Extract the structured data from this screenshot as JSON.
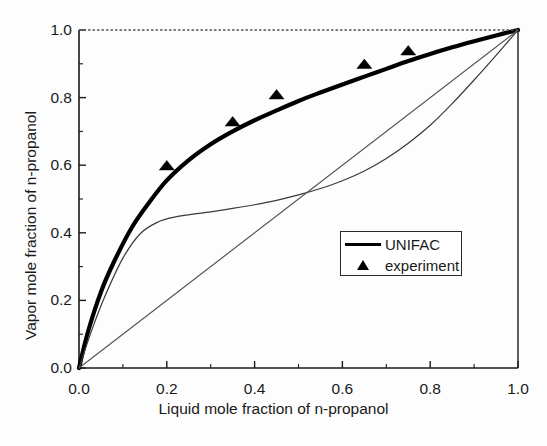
{
  "chart_data": {
    "type": "line",
    "title": "",
    "subtitle": "",
    "xlabel": "Liquid mole fraction of n-propanol",
    "ylabel": "Vapor mole fraction of n-propanol",
    "xlim": [
      0.0,
      1.0
    ],
    "ylim": [
      0.0,
      1.0
    ],
    "xticks": [
      "0.0",
      "0.2",
      "0.4",
      "0.6",
      "0.8",
      "1.0"
    ],
    "xtick_values": [
      0.0,
      0.2,
      0.4,
      0.6,
      0.8,
      1.0
    ],
    "yticks": [
      "0.0",
      "0.2",
      "0.4",
      "0.6",
      "0.8",
      "1.0"
    ],
    "ytick_values": [
      0.0,
      0.2,
      0.4,
      0.6,
      0.8,
      1.0
    ],
    "minor_ticks": true,
    "grid": false,
    "legend_position": "center-right",
    "series": [
      {
        "name": "UNIFAC",
        "style": "thick-line",
        "color": "#000000",
        "x": [
          0.0,
          0.02,
          0.05,
          0.08,
          0.12,
          0.16,
          0.2,
          0.25,
          0.3,
          0.35,
          0.4,
          0.45,
          0.5,
          0.55,
          0.6,
          0.65,
          0.7,
          0.75,
          0.8,
          0.85,
          0.9,
          0.95,
          1.0
        ],
        "y": [
          0.0,
          0.105,
          0.225,
          0.315,
          0.415,
          0.49,
          0.555,
          0.615,
          0.662,
          0.7,
          0.733,
          0.762,
          0.79,
          0.815,
          0.839,
          0.862,
          0.885,
          0.908,
          0.929,
          0.949,
          0.967,
          0.984,
          1.0
        ]
      },
      {
        "name": "second-model-curve",
        "style": "thin-line",
        "color": "#3a3a3a",
        "x": [
          0.0,
          0.03,
          0.06,
          0.1,
          0.14,
          0.18,
          0.22,
          0.26,
          0.3,
          0.35,
          0.4,
          0.45,
          0.5,
          0.55,
          0.6,
          0.65,
          0.7,
          0.75,
          0.8,
          0.85,
          0.9,
          0.95,
          1.0
        ],
        "y": [
          0.0,
          0.115,
          0.215,
          0.325,
          0.398,
          0.432,
          0.447,
          0.455,
          0.462,
          0.472,
          0.483,
          0.496,
          0.512,
          0.531,
          0.554,
          0.583,
          0.62,
          0.665,
          0.718,
          0.782,
          0.852,
          0.925,
          1.0
        ]
      },
      {
        "name": "diagonal-reference-line",
        "style": "thin-line",
        "color": "#555555",
        "x": [
          0.0,
          1.0
        ],
        "y": [
          0.0,
          1.0
        ]
      },
      {
        "name": "top-boundary-dashed",
        "style": "dashed-line",
        "color": "#555555",
        "x": [
          0.0,
          1.0
        ],
        "y": [
          1.0,
          1.0
        ]
      },
      {
        "name": "experiment",
        "style": "triangle-markers",
        "color": "#000000",
        "x": [
          0.2,
          0.35,
          0.45,
          0.65,
          0.75
        ],
        "y": [
          0.6,
          0.73,
          0.81,
          0.9,
          0.94
        ]
      }
    ]
  },
  "legend": {
    "entries": [
      {
        "label": "UNIFAC",
        "key": "line"
      },
      {
        "label": "experiment",
        "key": "triangle"
      }
    ]
  }
}
